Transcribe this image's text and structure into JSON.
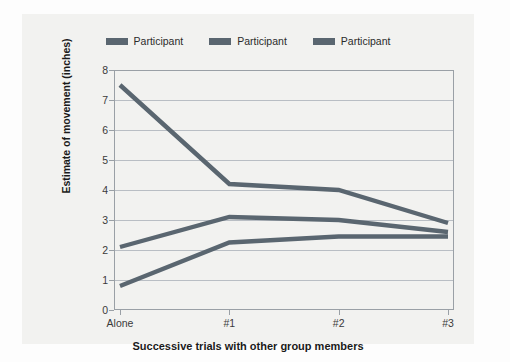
{
  "chart_data": {
    "type": "line",
    "title": "",
    "xlabel": "Successive trials with other group members",
    "ylabel": "Estimate of movement (inches)",
    "categories": [
      "Alone",
      "#1",
      "#2",
      "#3"
    ],
    "ylim": [
      0,
      8
    ],
    "yticks": [
      0,
      1,
      2,
      3,
      4,
      5,
      6,
      7,
      8
    ],
    "ytick_labels": [
      "0",
      "1",
      "2",
      "3",
      "4",
      "5",
      "6",
      "7",
      "8"
    ],
    "grid": "horizontal",
    "legend_position": "top-center",
    "series": [
      {
        "name": "Participant",
        "color": "#5a6670",
        "values": [
          7.5,
          4.2,
          4.0,
          2.9
        ]
      },
      {
        "name": "Participant",
        "color": "#5a6670",
        "values": [
          2.1,
          3.1,
          3.0,
          2.6
        ]
      },
      {
        "name": "Participant",
        "color": "#5a6670",
        "values": [
          0.8,
          2.25,
          2.45,
          2.45
        ]
      }
    ]
  },
  "legend": {
    "items": [
      {
        "label": "Participant",
        "color": "#5a6670"
      },
      {
        "label": "Participant",
        "color": "#5a6670"
      },
      {
        "label": "Participant",
        "color": "#5a6670"
      }
    ]
  },
  "axes": {
    "y_title": "Estimate of movement (inches)",
    "x_title": "Successive trials with other group members"
  },
  "colors": {
    "series": "#5a6670",
    "gridline": "#b9bec4",
    "axis": "#9aa0a6",
    "panel_background": "#f2f2f0",
    "page_background": "#fdfdfd",
    "text": "#1a1a1a"
  }
}
